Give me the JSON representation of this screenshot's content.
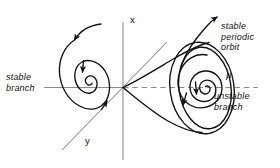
{
  "figure": {
    "name": "hopf-bifurcation-diagram",
    "background_color": "#ffffff",
    "ink_color": "#111111",
    "axis_color": "#8a8a8a"
  },
  "axes": {
    "vertical": {
      "label": "x",
      "style": "solid",
      "color": "#8a8a8a"
    },
    "diagonal": {
      "label": "y",
      "style": "solid",
      "color": "#8a8a8a"
    },
    "horizontal": {
      "label": "μ",
      "left_style": "solid",
      "right_style": "dashed",
      "color": "#8a8a8a"
    }
  },
  "annotations": {
    "stable_branch": "stable\nbranch",
    "stable_periodic_orbit": "stable\nperiodic\norbit",
    "unstable_branch": "unstable\nbranch",
    "mu_symbol": "μ",
    "x_axis": "x",
    "y_axis": "y"
  },
  "features": {
    "left_spiral": {
      "type": "inward-spiral",
      "meaning": "stable focus",
      "center": [
        83,
        88
      ],
      "arrow_count": 3
    },
    "right_spiral": {
      "type": "outward-spiral",
      "meaning": "unstable focus",
      "center": [
        203,
        89
      ],
      "arrow_count": 2
    },
    "limit_cycle": {
      "type": "closed-orbit",
      "meaning": "stable periodic orbit"
    },
    "paraboloid": {
      "type": "trumpet-surface",
      "apex": [
        123,
        87
      ]
    },
    "incoming_trajectory_left": {
      "arrow_direction": "down-left"
    },
    "incoming_trajectory_right": {
      "arrow_direction": "up-right"
    }
  }
}
